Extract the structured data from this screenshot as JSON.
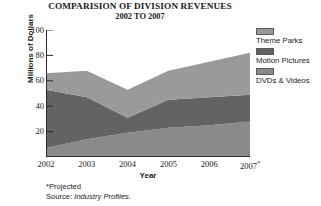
{
  "title": {
    "main": "COMPARISION OF DIVISION REVENUES",
    "sub": "2002 TO 2007"
  },
  "axes": {
    "ylabel": "Millions of Dollars",
    "xlabel": "Year"
  },
  "legend": {
    "items": [
      {
        "label": "Theme Parks",
        "color": "#9a9a9a"
      },
      {
        "label": "Motion Pictures",
        "color": "#636363"
      },
      {
        "label": "DVDs & Videos",
        "color": "#8a8a8a"
      }
    ]
  },
  "footnotes": {
    "projected": "*Projected",
    "source_prefix": "Source: ",
    "source_title": "Industry Profiles."
  },
  "chart_data": {
    "type": "area",
    "stacked": true,
    "title": "COMPARISION OF DIVISION REVENUES 2002 TO 2007",
    "xlabel": "Year",
    "ylabel": "Millions of Dollars",
    "ylim": [
      0,
      100
    ],
    "yticks": [
      20,
      40,
      60,
      80,
      100
    ],
    "grid": false,
    "legend_position": "right",
    "categories": [
      "2002",
      "2003",
      "2004",
      "2005",
      "2006",
      "2007*"
    ],
    "series": [
      {
        "name": "DVDs & Videos",
        "color": "#8a8a8a",
        "values": [
          7,
          14,
          19,
          23,
          25,
          28
        ]
      },
      {
        "name": "Motion Pictures",
        "color": "#636363",
        "values": [
          46,
          33,
          12,
          22,
          22,
          21
        ]
      },
      {
        "name": "Theme Parks",
        "color": "#9a9a9a",
        "values": [
          13,
          21,
          22,
          23,
          28,
          33
        ]
      }
    ],
    "cumulative_tops": {
      "DVDs & Videos": [
        7,
        14,
        19,
        23,
        25,
        28
      ],
      "Motion Pictures": [
        53,
        47,
        31,
        45,
        47,
        49
      ],
      "Theme Parks": [
        66,
        68,
        53,
        68,
        75,
        82
      ]
    },
    "annotations": [
      "*Projected",
      "Source: Industry Profiles."
    ]
  }
}
